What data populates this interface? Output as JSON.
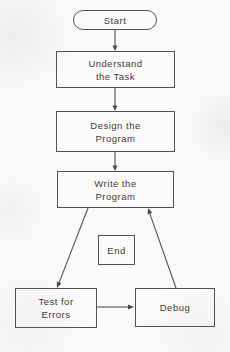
{
  "diagram": {
    "type": "flowchart",
    "nodes": {
      "start": {
        "label": "Start",
        "shape": "stadium"
      },
      "understand_task": {
        "lines": [
          "Understand",
          "the Task"
        ],
        "shape": "rectangle"
      },
      "design_program": {
        "lines": [
          "Design the",
          "Program"
        ],
        "shape": "rectangle"
      },
      "write_program": {
        "lines": [
          "Write the",
          "Program"
        ],
        "shape": "rectangle"
      },
      "end": {
        "label": "End",
        "shape": "rectangle"
      },
      "test_errors": {
        "lines": [
          "Test for",
          "Errors"
        ],
        "shape": "rectangle"
      },
      "debug": {
        "label": "Debug",
        "shape": "rectangle"
      }
    },
    "edges": [
      {
        "from": "start",
        "to": "understand_task"
      },
      {
        "from": "understand_task",
        "to": "design_program"
      },
      {
        "from": "design_program",
        "to": "write_program"
      },
      {
        "from": "write_program",
        "to": "test_errors"
      },
      {
        "from": "test_errors",
        "to": "debug"
      },
      {
        "from": "debug",
        "to": "write_program"
      }
    ],
    "colors": {
      "line": "#525252",
      "text": "#3c3c3c",
      "background": "#fbfaf8"
    }
  }
}
